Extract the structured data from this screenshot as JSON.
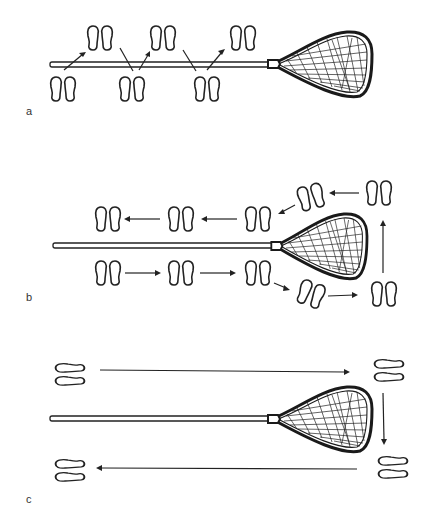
{
  "figure": {
    "colors": {
      "ink": "#222222",
      "background": "#ffffff"
    },
    "panels": [
      {
        "label": "a",
        "pattern": "zigzag forward along stick shaft",
        "footprint_pairs": [
          {
            "id": "a1",
            "orientation": "vertical"
          },
          {
            "id": "a2",
            "orientation": "vertical"
          },
          {
            "id": "a3",
            "orientation": "vertical"
          },
          {
            "id": "a4",
            "orientation": "vertical"
          },
          {
            "id": "a5",
            "orientation": "vertical"
          },
          {
            "id": "a6",
            "orientation": "vertical"
          }
        ],
        "arrows": 5
      },
      {
        "label": "b",
        "pattern": "loop around stick: forward below, up behind head, back above",
        "footprint_pairs": [
          {
            "id": "b1",
            "orientation": "vertical"
          },
          {
            "id": "b2",
            "orientation": "vertical"
          },
          {
            "id": "b3",
            "orientation": "vertical"
          },
          {
            "id": "b4",
            "orientation": "diagonal"
          },
          {
            "id": "b5",
            "orientation": "vertical"
          },
          {
            "id": "b6",
            "orientation": "vertical"
          },
          {
            "id": "b7",
            "orientation": "diagonal"
          },
          {
            "id": "b8",
            "orientation": "vertical"
          },
          {
            "id": "b9",
            "orientation": "vertical"
          },
          {
            "id": "b10",
            "orientation": "vertical"
          }
        ],
        "arrows": 8
      },
      {
        "label": "c",
        "pattern": "lateral shuffle: right along top, down, left along bottom",
        "footprint_pairs": [
          {
            "id": "c1",
            "orientation": "horizontal"
          },
          {
            "id": "c2",
            "orientation": "horizontal"
          },
          {
            "id": "c3",
            "orientation": "horizontal"
          },
          {
            "id": "c4",
            "orientation": "horizontal"
          }
        ],
        "arrows": 3
      }
    ]
  }
}
